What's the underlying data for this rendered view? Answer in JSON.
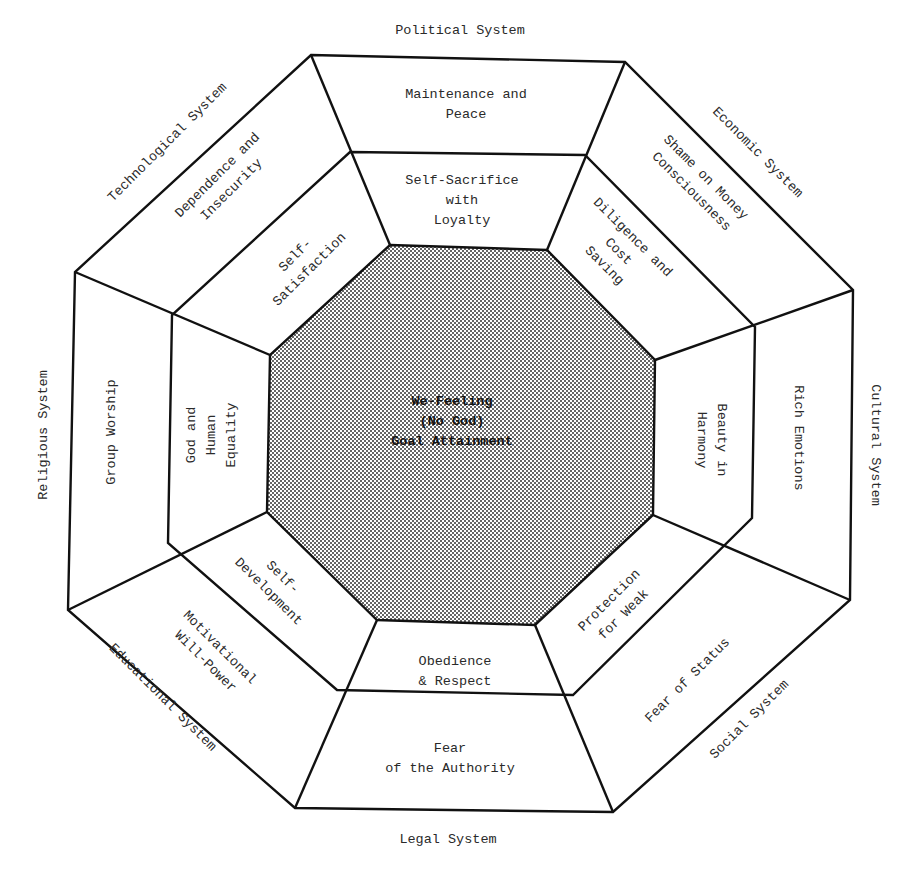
{
  "diagram": {
    "center": {
      "lines": [
        "We-Feeling",
        "(No God)",
        "Goal Attainment"
      ]
    },
    "systems": [
      {
        "name": "Political System",
        "outer": [
          "Maintenance and",
          "Peace"
        ],
        "inner": [
          "Self-Sacrifice",
          "with",
          "Loyalty"
        ]
      },
      {
        "name": "Economic System",
        "outer": [
          "Shame on Money",
          "Consciousness"
        ],
        "inner": [
          "Diligence and",
          "Cost",
          "Saving"
        ]
      },
      {
        "name": "Cultural System",
        "outer": [
          "Rich Emotions"
        ],
        "inner": [
          "Beauty in",
          "Harmony"
        ]
      },
      {
        "name": "Social System",
        "outer": [
          "Fear of Status"
        ],
        "inner": [
          "Protection",
          "for Weak"
        ]
      },
      {
        "name": "Legal System",
        "outer": [
          "Fear",
          "of the Authority"
        ],
        "inner": [
          "Obedience",
          "& Respect"
        ]
      },
      {
        "name": "Educational System",
        "outer": [
          "Motivational",
          "Will-Power"
        ],
        "inner": [
          "Self-",
          "Development"
        ]
      },
      {
        "name": "Religious System",
        "outer": [
          "Group Worship"
        ],
        "inner": [
          "God and",
          "Human",
          "Equality"
        ]
      },
      {
        "name": "Technological System",
        "outer": [
          "Dependence and",
          "Insecurity"
        ],
        "inner": [
          "Self-",
          "Satisfaction"
        ]
      }
    ],
    "colors": {
      "line": "#111111",
      "text": "#2a2a2a",
      "center_fill": "#c8c8c8"
    }
  }
}
